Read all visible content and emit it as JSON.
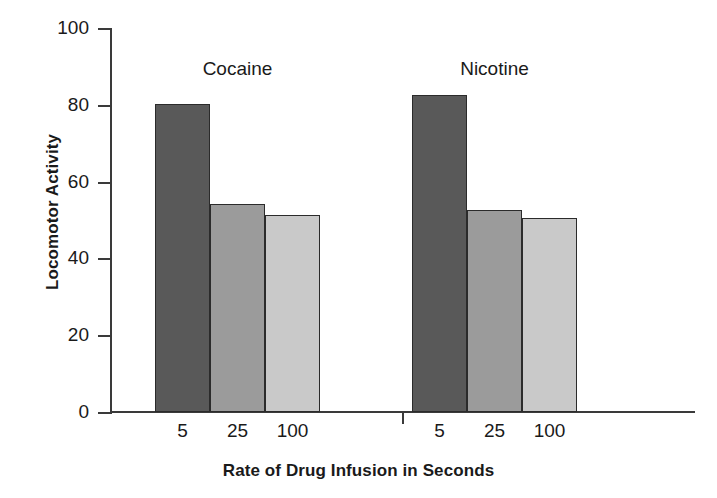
{
  "chart_data": {
    "type": "bar",
    "title": "",
    "xlabel": "Rate of Drug Infusion in Seconds",
    "ylabel": "Locomotor Activity",
    "ylim": [
      0,
      100
    ],
    "yticks": [
      0,
      20,
      40,
      60,
      80,
      100
    ],
    "ytick_labels": [
      "0",
      "20",
      "40",
      "60",
      "80",
      "100"
    ],
    "grid": false,
    "legend": "none",
    "categories": [
      "5",
      "25",
      "100"
    ],
    "group_labels": [
      "Cocaine",
      "Nicotine"
    ],
    "groups": [
      {
        "name": "Cocaine",
        "bars": [
          {
            "category": "5",
            "value": 80.2,
            "fill": "#595959"
          },
          {
            "category": "25",
            "value": 54.2,
            "fill": "#9b9b9b"
          },
          {
            "category": "100",
            "value": 51.3,
            "fill": "#c9c9c9"
          }
        ]
      },
      {
        "name": "Nicotine",
        "bars": [
          {
            "category": "5",
            "value": 82.5,
            "fill": "#595959"
          },
          {
            "category": "25",
            "value": 52.6,
            "fill": "#9b9b9b"
          },
          {
            "category": "100",
            "value": 50.6,
            "fill": "#c9c9c9"
          }
        ]
      }
    ],
    "colors": {
      "bar_5": "#595959",
      "bar_25": "#9b9b9b",
      "bar_100": "#c9c9c9",
      "axis": "#3a3a3a",
      "text": "#1a1a1a",
      "background": "#ffffff"
    }
  }
}
